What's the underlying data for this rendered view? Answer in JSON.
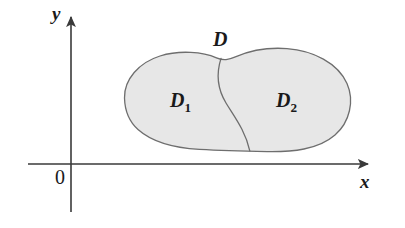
{
  "figure": {
    "kind": "math-diagram",
    "background_color": "#ffffff",
    "axes": {
      "x_axis_label": "x",
      "y_axis_label": "y",
      "origin_label": "0",
      "axis_color": "#3a3a3a",
      "axis_stroke_width": 1.6,
      "x_axis_y": 164,
      "x_axis_start_x": 28,
      "x_axis_end_x": 374,
      "y_axis_x": 71,
      "y_axis_top_y": 12,
      "y_axis_bottom_y": 212,
      "arrowheads": [
        "x-positive",
        "y-positive"
      ]
    },
    "region": {
      "outer_label": "D",
      "fill_color": "#e7e7e7",
      "stroke_color": "#6e6e6e",
      "stroke_width": 1.3,
      "divider_stroke_color": "#6e6e6e",
      "divider_stroke_width": 1.3,
      "subregions": [
        {
          "label_base": "D",
          "label_sub": "1"
        },
        {
          "label_base": "D",
          "label_sub": "2"
        }
      ]
    }
  }
}
